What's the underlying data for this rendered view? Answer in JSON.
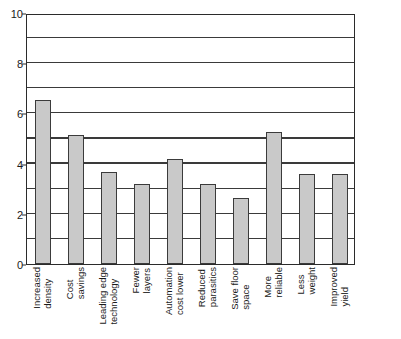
{
  "chart_data": {
    "type": "bar",
    "title": "",
    "subtitle": "",
    "xlabel": "",
    "ylabel": "",
    "ylim": [
      0,
      10
    ],
    "grid": true,
    "grid_axis": "y",
    "legend": false,
    "legend_position": "none",
    "y_ticks_major": [
      0,
      2,
      4,
      6,
      8,
      10
    ],
    "y_ticks_minor": [
      1,
      3,
      5,
      7,
      9
    ],
    "y_tick_labels": [
      "0",
      "2",
      "4",
      "6",
      "8",
      "10"
    ],
    "bar_fill_color": "#c9c9c9",
    "bar_edge_color": "#3b3b3b",
    "axis_color": "#2b2b2b",
    "background_color": "#ffffff",
    "categories": [
      "Increased density",
      "Cost savings",
      "Leading edge technology",
      "Fewer layers",
      "Automation cost lower",
      "Reduced parasitics",
      "Save floor space",
      "More reliable",
      "Less weight",
      "Improved yield"
    ],
    "category_lines": [
      [
        "Increased",
        "density"
      ],
      [
        "Cost",
        "savings"
      ],
      [
        "Leading edge",
        "technology"
      ],
      [
        "Fewer",
        "layers"
      ],
      [
        "Automation",
        "cost lower"
      ],
      [
        "Reduced",
        "parasitics"
      ],
      [
        "Save floor",
        "space"
      ],
      [
        "More",
        "reliable"
      ],
      [
        "Less",
        "weight"
      ],
      [
        "Improved",
        "yield"
      ]
    ],
    "values": [
      6.55,
      5.15,
      3.65,
      3.2,
      4.2,
      3.2,
      2.65,
      5.25,
      3.6,
      3.6
    ]
  }
}
